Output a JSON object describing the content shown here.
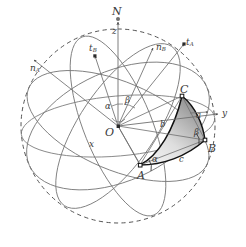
{
  "figure": {
    "title": "",
    "type": "spherical-triangle-diagram",
    "colors": {
      "line": "#6b6b6b",
      "dashed": "#5a5a5a",
      "triangle_edge": "#111111",
      "fill_dark": "#8f8f8f",
      "fill_light": "#e8e8e8",
      "label": "#3a3a3a",
      "background": "#ffffff"
    },
    "points": {
      "north_pole": "N",
      "origin": "O",
      "vertex_a": "A",
      "vertex_b": "B",
      "vertex_c": "C"
    },
    "axes": {
      "z": "z",
      "x": "x",
      "y": "y"
    },
    "vectors": {
      "t_a": "t",
      "t_a_sub": "A",
      "t_b": "t",
      "t_b_sub": "B",
      "n_a": "n",
      "n_a_sub": "A",
      "n_b": "n",
      "n_b_sub": "B"
    },
    "sides": {
      "a": "a",
      "b": "b",
      "c": "c"
    },
    "angles": {
      "alpha_center": "α",
      "beta_center": "β",
      "alpha_vertex": "α",
      "beta_vertex": "β"
    }
  }
}
